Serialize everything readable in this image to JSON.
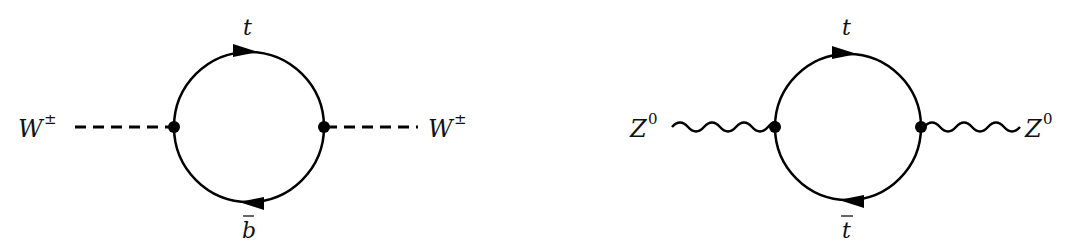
{
  "diagrams": [
    {
      "name": "W boson self-energy top-bottom loop",
      "external_left": {
        "label": "W",
        "superscript": "±",
        "line_style": "dashed"
      },
      "external_right": {
        "label": "W",
        "superscript": "±",
        "line_style": "dashed"
      },
      "loop_top": {
        "label": "t",
        "arrow_direction": "right"
      },
      "loop_bottom": {
        "label": "b",
        "bar": true,
        "arrow_direction": "left"
      }
    },
    {
      "name": "Z boson self-energy top loop",
      "external_left": {
        "label": "Z",
        "superscript": "0",
        "line_style": "wavy"
      },
      "external_right": {
        "label": "Z",
        "superscript": "0",
        "line_style": "wavy"
      },
      "loop_top": {
        "label": "t",
        "arrow_direction": "right"
      },
      "loop_bottom": {
        "label": "t",
        "bar": true,
        "arrow_direction": "left"
      }
    }
  ],
  "colors": {
    "line": "#000000",
    "background": "#ffffff"
  }
}
